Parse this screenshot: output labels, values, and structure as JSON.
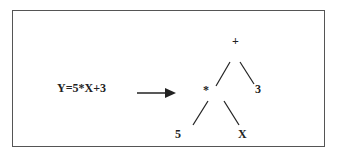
{
  "diagram": {
    "expression": "Y=5*X+3",
    "tree": {
      "root": "+",
      "left": {
        "value": "*",
        "left": "5",
        "right": "X"
      },
      "right": "3"
    },
    "nodes": {
      "root": "+",
      "mul": "*",
      "three": "3",
      "five": "5",
      "x": "X"
    },
    "arrow": "arrow-right-icon"
  }
}
